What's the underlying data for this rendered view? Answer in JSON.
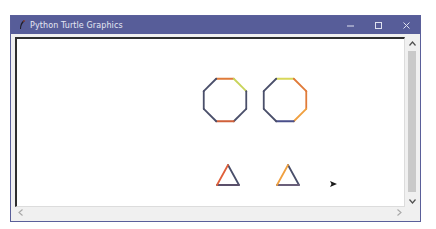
{
  "window": {
    "title": "Python Turtle Graphics",
    "controls": {
      "minimize": "minimize",
      "maximize": "maximize",
      "close": "close"
    }
  },
  "colors": {
    "titlebar": "#575d99",
    "octagon1_edges": [
      "#e07b3a",
      "#c8d45a",
      "#4a4f6a",
      "#4a4f6a",
      "#d0603a",
      "#4a4f6a",
      "#4a4f6a",
      "#4a4f6a"
    ],
    "octagon2_edges": [
      "#d8d85a",
      "#e07b3a",
      "#e07b3a",
      "#f0a040",
      "#4a4f8a",
      "#4a4f6a",
      "#4a4f6a",
      "#4a4f6a"
    ],
    "triangle1_edges": [
      "#4a4f6a",
      "#5a4f6a",
      "#e0603a"
    ],
    "triangle2_edges": [
      "#4a4f6a",
      "#6a5f7a",
      "#f0a040"
    ],
    "turtle": "#1a1a1a"
  },
  "canvas": {
    "shapes": [
      {
        "type": "octagon",
        "cx": 222,
        "cy": 99,
        "r": 23
      },
      {
        "type": "octagon",
        "cx": 282,
        "cy": 99,
        "r": 23
      },
      {
        "type": "triangle",
        "cx": 225,
        "cy": 175
      },
      {
        "type": "triangle",
        "cx": 285,
        "cy": 175
      }
    ],
    "turtle_cursor": {
      "x": 330,
      "y": 183
    }
  },
  "scrollbars": {
    "vertical": {
      "up": "up-arrow",
      "down": "down-arrow"
    },
    "horizontal": {
      "left": "left-arrow",
      "right": "right-arrow"
    }
  }
}
